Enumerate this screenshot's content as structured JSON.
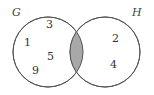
{
  "diagram": {
    "type": "venn",
    "title": "",
    "canvas": {
      "width": 154,
      "height": 95,
      "background": "#ffffff"
    },
    "sets": [
      {
        "id": "G",
        "label": "G",
        "cx": 48,
        "cy": 52,
        "r": 35,
        "stroke": "#555555",
        "fill": "#ffffff"
      },
      {
        "id": "H",
        "label": "H",
        "cx": 105,
        "cy": 52,
        "r": 35,
        "stroke": "#555555",
        "fill": "#ffffff"
      }
    ],
    "intersection": {
      "shaded": true,
      "fill": "#a8a8a8",
      "stroke": "#555555",
      "region_name": "G-intersect-H"
    },
    "elements": [
      {
        "value": "3",
        "region": "G-only",
        "x": 46,
        "y": 19
      },
      {
        "value": "1",
        "region": "G-only",
        "x": 24,
        "y": 37
      },
      {
        "value": "5",
        "region": "G-only",
        "x": 47,
        "y": 51
      },
      {
        "value": "9",
        "region": "G-only",
        "x": 32,
        "y": 65
      },
      {
        "value": "2",
        "region": "H-only",
        "x": 112,
        "y": 33
      },
      {
        "value": "4",
        "region": "H-only",
        "x": 110,
        "y": 59
      }
    ]
  }
}
